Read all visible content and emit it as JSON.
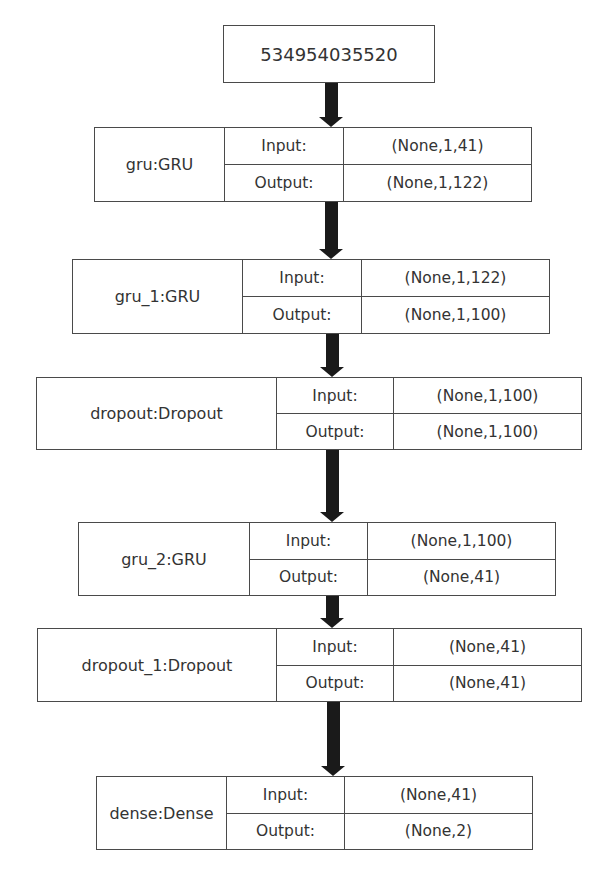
{
  "diagram": {
    "type": "neural-network-architecture",
    "input_node": {
      "label": "534954035520"
    },
    "labels": {
      "input": "Input:",
      "output": "Output:"
    },
    "layers": [
      {
        "name": "gru:GRU",
        "input_shape": "(None,1,41)",
        "output_shape": "(None,1,122)"
      },
      {
        "name": "gru_1:GRU",
        "input_shape": "(None,1,122)",
        "output_shape": "(None,1,100)"
      },
      {
        "name": "dropout:Dropout",
        "input_shape": "(None,1,100)",
        "output_shape": "(None,1,100)"
      },
      {
        "name": "gru_2:GRU",
        "input_shape": "(None,1,100)",
        "output_shape": "(None,41)"
      },
      {
        "name": "dropout_1:Dropout",
        "input_shape": "(None,41)",
        "output_shape": "(None,41)"
      },
      {
        "name": "dense:Dense",
        "input_shape": "(None,41)",
        "output_shape": "(None,2)"
      }
    ],
    "colors": {
      "border": "#4a4a4a",
      "arrow": "#1a1a1a",
      "text": "#333333",
      "background": "#ffffff"
    }
  }
}
